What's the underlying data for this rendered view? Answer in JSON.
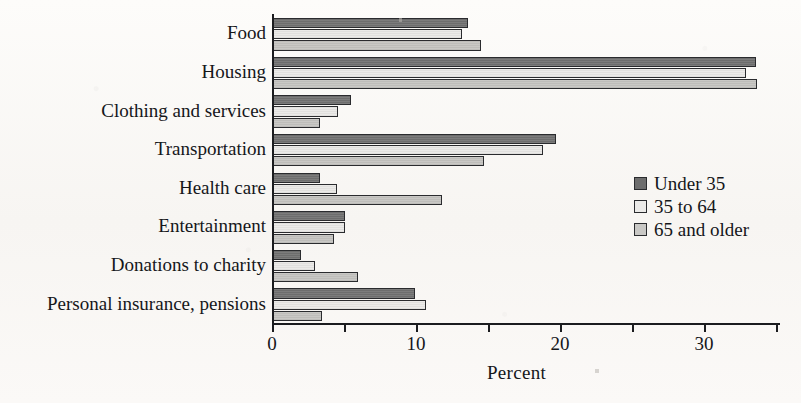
{
  "chart_data": {
    "type": "bar",
    "orientation": "horizontal",
    "title": "",
    "xlabel": "Percent",
    "ylabel": "",
    "xlim": [
      0,
      35
    ],
    "xticks": [
      0,
      5,
      10,
      15,
      20,
      25,
      30,
      35
    ],
    "xtick_labels": [
      "0",
      "",
      "10",
      "",
      "20",
      "",
      "30",
      ""
    ],
    "grid": false,
    "legend_position": "middle-right",
    "categories": [
      "Food",
      "Housing",
      "Clothing and services",
      "Transportation",
      "Health care",
      "Entertainment",
      "Donations to charity",
      "Personal insurance, pensions"
    ],
    "series": [
      {
        "name": "Under 35",
        "color": "#6d6d6d",
        "values": [
          13.6,
          33.6,
          5.5,
          19.7,
          3.3,
          5.1,
          2.0,
          9.9
        ]
      },
      {
        "name": "35 to 64",
        "color": "#ebeae8",
        "values": [
          13.2,
          32.9,
          4.6,
          18.8,
          4.5,
          5.1,
          3.0,
          10.7
        ]
      },
      {
        "name": "65 and older",
        "color": "#c9c8c5",
        "values": [
          14.5,
          33.7,
          3.3,
          14.7,
          11.8,
          4.3,
          6.0,
          3.5
        ]
      }
    ]
  },
  "legend": {
    "items": [
      {
        "label": "Under 35"
      },
      {
        "label": "35 to 64"
      },
      {
        "label": "65 and older"
      }
    ]
  },
  "axis": {
    "x_title": "Percent"
  }
}
